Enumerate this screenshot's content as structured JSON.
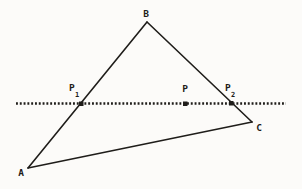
{
  "colors": {
    "ink": "#1f1d1a",
    "paper": "#fcfbf9"
  },
  "diagram": {
    "vertex_a": "A",
    "vertex_b": "B",
    "vertex_c": "C",
    "point_p1_base": "P",
    "point_p1_sub": "1",
    "point_p": "P",
    "point_p2_base": "P",
    "point_p2_sub": "2"
  }
}
